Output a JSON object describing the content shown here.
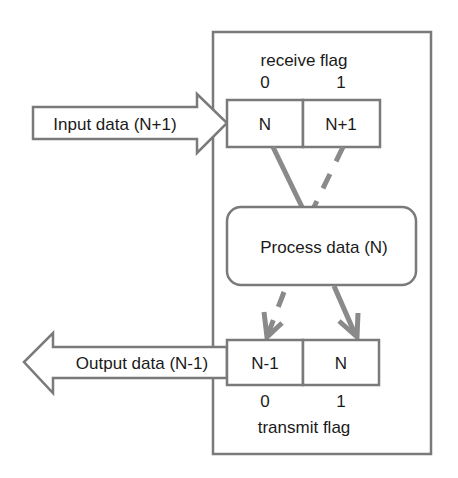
{
  "diagram": {
    "colors": {
      "stroke": "#7a7a7a",
      "connector": "#8a8a8a",
      "text": "#1a1a1a",
      "background": "#ffffff"
    },
    "input_arrow": {
      "label": "Input data (N+1)",
      "direction": "right"
    },
    "output_arrow": {
      "label": "Output data (N-1)",
      "direction": "left"
    },
    "receive_buffer": {
      "title": "receive flag",
      "slots": [
        {
          "flag": "0",
          "value": "N"
        },
        {
          "flag": "1",
          "value": "N+1"
        }
      ]
    },
    "process": {
      "label": "Process data (N)"
    },
    "transmit_buffer": {
      "title": "transmit flag",
      "slots": [
        {
          "flag": "0",
          "value": "N-1"
        },
        {
          "flag": "1",
          "value": "N"
        }
      ]
    },
    "connections": [
      {
        "from": "receive-slot-0",
        "to": "process",
        "style": "solid",
        "arrowhead": false
      },
      {
        "from": "receive-slot-1",
        "to": "process",
        "style": "dashed",
        "arrowhead": false
      },
      {
        "from": "process",
        "to": "transmit-slot-0",
        "style": "dashed",
        "arrowhead": true
      },
      {
        "from": "process",
        "to": "transmit-slot-1",
        "style": "solid",
        "arrowhead": true
      }
    ]
  }
}
